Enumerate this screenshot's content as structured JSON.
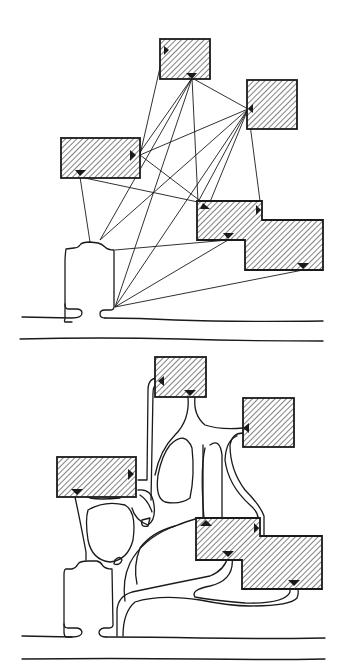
{
  "figure": {
    "panels": [
      {
        "id": "top",
        "label": "direct-connections",
        "buildings": [
          {
            "name": "top-building",
            "shape": "rect",
            "x": 160,
            "y": 39,
            "w": 50,
            "h": 40
          },
          {
            "name": "right-building",
            "shape": "rect",
            "x": 247,
            "y": 80,
            "w": 50,
            "h": 49
          },
          {
            "name": "left-building",
            "shape": "rect",
            "x": 61,
            "y": 138,
            "w": 79,
            "h": 40
          },
          {
            "name": "l-shaped-building",
            "shape": "L",
            "points": "197,201 262,201 262,220 323,220 323,270 245,270 245,240 197,240"
          }
        ],
        "entry": {
          "name": "entry-building"
        },
        "road_y": [
          317,
          339
        ]
      },
      {
        "id": "bottom",
        "label": "organic-path-network",
        "buildings": [
          {
            "name": "top-building",
            "shape": "rect",
            "x": 155,
            "y": 357,
            "w": 51,
            "h": 40
          },
          {
            "name": "right-building",
            "shape": "rect",
            "x": 243,
            "y": 398,
            "w": 51,
            "h": 49
          },
          {
            "name": "left-building",
            "shape": "rect",
            "x": 57,
            "y": 457,
            "w": 79,
            "h": 40
          },
          {
            "name": "l-shaped-building",
            "shape": "L",
            "points": "196,518 260,518 260,536 322,536 322,589 242,589 242,560 196,560"
          }
        ],
        "entry": {
          "name": "entry-building"
        },
        "road_y": [
          637,
          659
        ]
      }
    ],
    "colors": {
      "ink": "#1a1a1a",
      "background": "#ffffff"
    }
  }
}
